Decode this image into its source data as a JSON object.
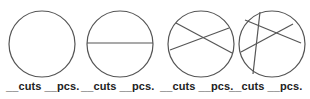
{
  "diagram": {
    "stroke_color": "#555555",
    "background": "#ffffff",
    "circles": [
      {
        "id": 1,
        "cx": 42,
        "cy": 44,
        "r": 33,
        "cuts": []
      },
      {
        "id": 2,
        "cx": 120,
        "cy": 44,
        "r": 33,
        "cuts": [
          {
            "x1": 87,
            "y1": 43,
            "x2": 153,
            "y2": 43
          }
        ]
      },
      {
        "id": 3,
        "cx": 201,
        "cy": 44,
        "r": 33,
        "cuts": [
          {
            "x1": 176,
            "y1": 23,
            "x2": 232,
            "y2": 53
          },
          {
            "x1": 170,
            "y1": 50,
            "x2": 229,
            "y2": 28
          }
        ]
      },
      {
        "id": 4,
        "cx": 272,
        "cy": 44,
        "r": 33,
        "cuts": [
          {
            "x1": 245,
            "y1": 20,
            "x2": 301,
            "y2": 43
          },
          {
            "x1": 241,
            "y1": 52,
            "x2": 293,
            "y2": 24
          },
          {
            "x1": 260,
            "y1": 12,
            "x2": 253,
            "y2": 74
          }
        ]
      }
    ]
  },
  "labels": [
    {
      "text": "__cuts __pcs.",
      "x": 6
    },
    {
      "text": "__cuts __pcs.",
      "x": 81
    },
    {
      "text": "__cuts __pcs.",
      "x": 160
    },
    {
      "text": "__cuts __pcs.",
      "x": 229
    }
  ]
}
